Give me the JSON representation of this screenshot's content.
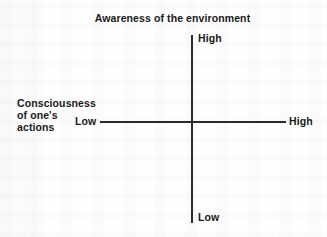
{
  "chart_data": {
    "type": "scatter",
    "title": "Awareness of the environment",
    "subtitle": "",
    "xlabel": "Consciousness of one's actions",
    "ylabel": "Awareness of the environment",
    "grid": false,
    "legend": null,
    "annotations": [],
    "series": [],
    "axes": {
      "vertical": {
        "label": "Awareness of the environment",
        "high_tick": "High",
        "low_tick": "Low"
      },
      "horizontal": {
        "label_lines": [
          "Consciousness",
          "of one's",
          "actions"
        ],
        "low_tick": "Low",
        "high_tick": "High"
      }
    },
    "colors": {
      "axis": "#2b2b2b",
      "text": "#1a1a1a",
      "background": "#fefefe"
    }
  },
  "diagram": {
    "title": "Awareness of the environment",
    "vertical_high": "High",
    "vertical_low": "Low",
    "horizontal_low": "Low",
    "horizontal_high": "High",
    "left_label": {
      "line1": "Consciousness",
      "line2": "of one's",
      "line3": "actions"
    }
  }
}
